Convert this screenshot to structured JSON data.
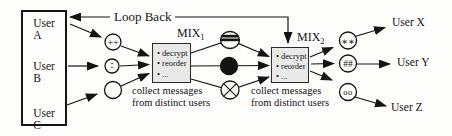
{
  "figure": {
    "loop_back": "Loop Back",
    "user_box": {
      "users": [
        "User A",
        "User B",
        "User C"
      ]
    },
    "mix1": {
      "name": "MIX",
      "sub": "1",
      "items": [
        "• decrypt",
        "• reorder",
        "• ..."
      ],
      "caption": "collect messages\nfrom distinct users"
    },
    "mix2": {
      "name": "MIX",
      "sub": "2",
      "items": [
        "• decrypt",
        "• reorder",
        "• ..."
      ],
      "caption": "collect messages\nfrom distinct users"
    },
    "receivers": [
      "User X",
      "User Y",
      "User Z"
    ],
    "glyphs": {
      "plus": "++",
      "dash": "-\n-",
      "stars": "∗∗",
      "hash": "##",
      "circles": "oo"
    },
    "colors": {
      "ink": "#141414",
      "mix_box_fill": "#e9e9e7",
      "background": "#fdfdfc"
    }
  }
}
